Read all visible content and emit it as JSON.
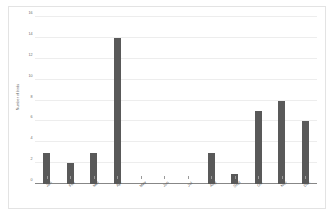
{
  "chart_data": {
    "type": "bar",
    "title": "",
    "xlabel": "",
    "ylabel": "Number of birds",
    "categories": [
      "Jan",
      "Feb",
      "Mar",
      "Apr",
      "May",
      "Jun",
      "Jul",
      "Aug",
      "Sept",
      "Oct",
      "Nov",
      "Dec"
    ],
    "values": [
      3,
      2,
      3,
      14,
      0,
      0,
      0,
      3,
      1,
      7,
      8,
      6
    ],
    "ylim": [
      0,
      16
    ],
    "yticks": [
      0,
      2,
      4,
      6,
      8,
      10,
      12,
      14,
      16
    ],
    "ytick_labels": [
      "0",
      "2",
      "4",
      "6",
      "8",
      "10",
      "12",
      "14",
      "16"
    ],
    "grid": true,
    "legend": false,
    "bar_color": "#595959",
    "background_color": "#ffffff",
    "gridline_color": "#ededed",
    "axis_color": "#878787"
  }
}
